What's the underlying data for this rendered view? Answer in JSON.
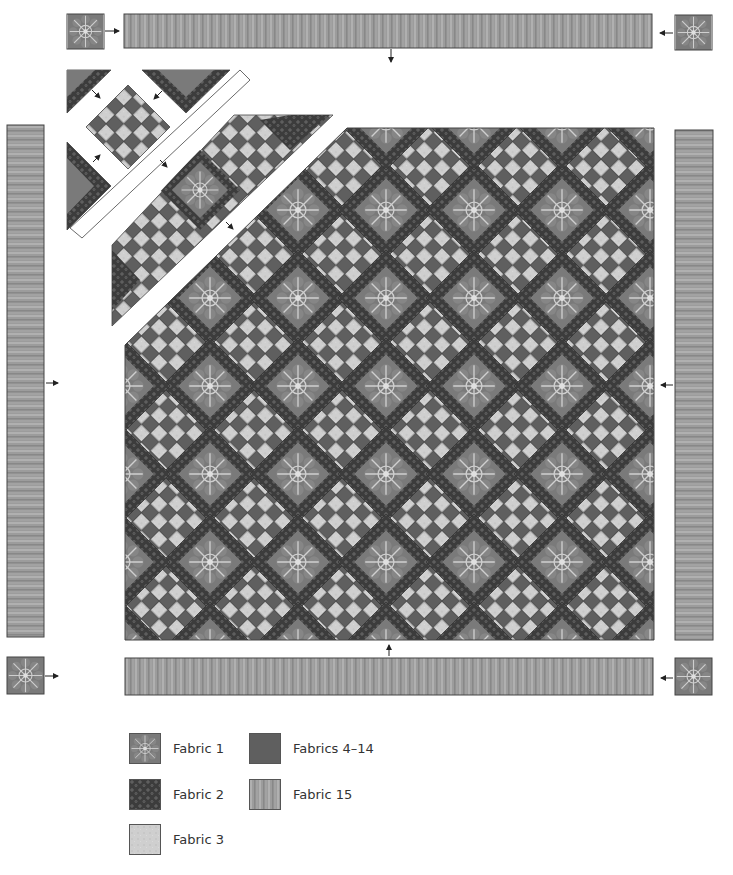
{
  "diagram": {
    "colors": {
      "fabric_1": "#7a7a7a",
      "fabric_1_motif": "#c8c8c8",
      "fabric_2": "#3e3e3e",
      "fabric_3": "#cfcfcf",
      "fabrics_4_14": "#5f5f5f",
      "fabric_15": "#9a9a9a",
      "outline": "#444444",
      "arrow": "#222222"
    },
    "pieces": {
      "top_border": "Fabric 15 border strip (top)",
      "bottom_border": "Fabric 15 border strip (bottom)",
      "left_border": "Fabric 15 border strip (left)",
      "right_border": "Fabric 15 border strip (right)",
      "corner_squares": "Fabric 1 corner squares (4)",
      "center": "On-point checkerboard center with Fabric 1 blocks framed by Fabric 2"
    }
  },
  "legend": {
    "items": [
      {
        "id": "fabric-1",
        "label": "Fabric 1"
      },
      {
        "id": "fabric-2",
        "label": "Fabric 2"
      },
      {
        "id": "fabric-3",
        "label": "Fabric 3"
      },
      {
        "id": "fabrics-4-14",
        "label": "Fabrics 4–14"
      },
      {
        "id": "fabric-15",
        "label": "Fabric 15"
      }
    ]
  }
}
